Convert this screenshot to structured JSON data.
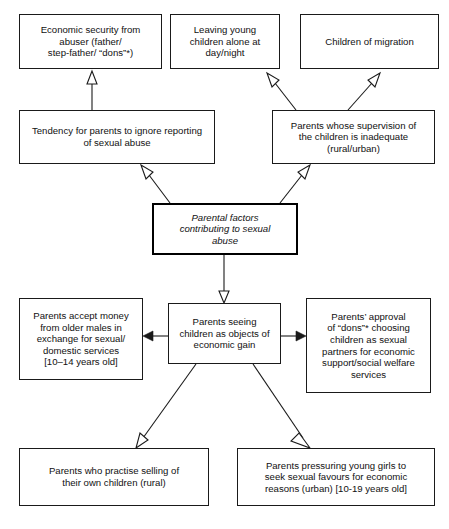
{
  "diagram": {
    "title": "Parental factors contributing to sexual abuse",
    "nodes": {
      "economic_security": "Economic security from\nabuser (father/\nstep-father/ “dons”*)",
      "leaving_children": "Leaving young\nchildren alone at\nday/night",
      "children_migration": "Children of migration",
      "tendency_ignore": "Tendency for parents to ignore reporting\nof sexual abuse",
      "supervision_inadequate": "Parents whose supervision of\nthe children is inadequate\n(rural/urban)",
      "central": "Parental factors\ncontributing to sexual\nabuse",
      "economic_gain": "Parents seeing\nchildren as objects of\neconomic gain",
      "accept_money": "Parents accept money\nfrom older males in\nexchange for sexual/\ndomestic services\n[10–14 years old]",
      "dons_approval": "Parents’ approval\nof “dons”* choosing\nchildren as sexual\npartners for economic\nsupport/social welfare\nservices",
      "selling_children": "Parents who practise selling of\ntheir own children (rural)",
      "pressuring_girls": "Parents pressuring young girls to\nseek sexual favours for economic\nreasons (urban) [10-19 years old]"
    },
    "colors": {
      "stroke": "#1a1a1a",
      "text": "#111111",
      "background": "#ffffff"
    }
  }
}
